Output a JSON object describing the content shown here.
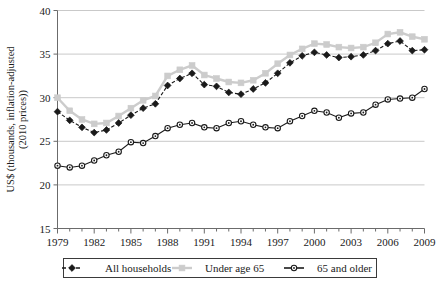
{
  "chart_data": {
    "type": "line",
    "title": "",
    "xlabel": "",
    "ylabel": "US$ (thousands, inflation-adjusted (2010 prices))",
    "ylim": [
      15,
      40
    ],
    "yticks": [
      15,
      20,
      25,
      30,
      35,
      40
    ],
    "ytick_labels": [
      "15",
      "20",
      "25",
      "30",
      "35",
      "40"
    ],
    "xlim": [
      1979,
      2009
    ],
    "xticks": [
      1979,
      1982,
      1985,
      1988,
      1991,
      1994,
      1997,
      2000,
      2003,
      2006,
      2009
    ],
    "xtick_labels": [
      "1979",
      "1982",
      "1985",
      "1988",
      "1991",
      "1994",
      "1997",
      "2000",
      "2003",
      "2006",
      "2009"
    ],
    "x": [
      1979,
      1980,
      1981,
      1982,
      1983,
      1984,
      1985,
      1986,
      1987,
      1988,
      1989,
      1990,
      1991,
      1992,
      1993,
      1994,
      1995,
      1996,
      1997,
      1998,
      1999,
      2000,
      2001,
      2002,
      2003,
      2004,
      2005,
      2006,
      2007,
      2008,
      2009
    ],
    "grid": true,
    "grid_axis": "y",
    "legend_position": "bottom",
    "series": [
      {
        "name": "All households",
        "color": "#1a1a1a",
        "marker": "diamond",
        "linestyle": "dashed",
        "values": [
          28.4,
          27.4,
          26.6,
          26.0,
          26.3,
          27.1,
          28.0,
          28.8,
          29.3,
          31.4,
          32.2,
          32.8,
          31.5,
          31.3,
          30.6,
          30.4,
          31.0,
          31.7,
          32.8,
          34.0,
          34.8,
          35.2,
          34.9,
          34.6,
          34.7,
          34.9,
          35.4,
          36.2,
          36.5,
          35.4,
          35.5
        ]
      },
      {
        "name": "Under age 65",
        "color": "#cccccc",
        "marker": "square",
        "linestyle": "solid",
        "values": [
          30.0,
          28.5,
          27.5,
          27.0,
          27.1,
          27.9,
          28.8,
          29.7,
          30.2,
          32.5,
          33.2,
          33.7,
          32.6,
          32.2,
          31.8,
          31.7,
          32.0,
          32.8,
          33.9,
          34.9,
          35.6,
          36.2,
          36.1,
          35.8,
          35.7,
          35.8,
          36.3,
          37.3,
          37.5,
          37.0,
          36.7
        ]
      },
      {
        "name": "65 and older",
        "color": "#1a1a1a",
        "marker": "circle-open",
        "linestyle": "solid",
        "values": [
          22.2,
          22.0,
          22.2,
          22.8,
          23.4,
          23.8,
          24.9,
          24.8,
          25.6,
          26.5,
          26.9,
          27.1,
          26.6,
          26.5,
          27.1,
          27.3,
          26.9,
          26.6,
          26.5,
          27.3,
          27.9,
          28.5,
          28.3,
          27.7,
          28.2,
          28.3,
          29.2,
          29.8,
          29.9,
          30.0,
          31.0
        ]
      }
    ]
  },
  "legend": {
    "items": [
      {
        "label": "All households"
      },
      {
        "label": "Under age 65"
      },
      {
        "label": "65 and older"
      }
    ]
  }
}
